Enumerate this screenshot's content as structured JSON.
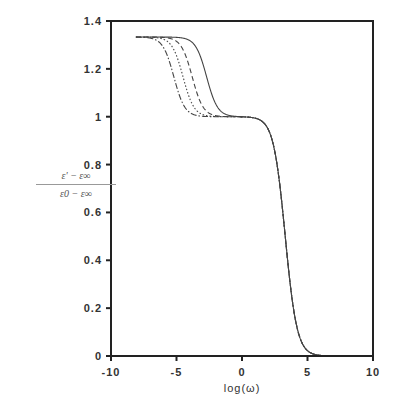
{
  "chart_data": {
    "type": "line",
    "title": "",
    "xlabel": "log(ω)",
    "ylabel": "(ε' − ε∞) / (ε0 − ε∞)",
    "ylabel_numerator": "ε' − ε∞",
    "ylabel_denominator": "ε0 − ε∞",
    "xlim": [
      -10,
      10
    ],
    "ylim": [
      0,
      1.4
    ],
    "xticks": [
      -10,
      -5,
      0,
      5,
      10
    ],
    "yticks": [
      0,
      0.2,
      0.4,
      0.6,
      0.8,
      1,
      1.2,
      1.4
    ],
    "xtick_labels": [
      "-10",
      "-5",
      "0",
      "5",
      "10"
    ],
    "ytick_labels": [
      "0",
      "0.2",
      "0.4",
      "0.6",
      "0.8",
      "1",
      "1.2",
      "1.4"
    ],
    "grid": false,
    "legend": null,
    "x_start": -8.1,
    "upper_level": 1.333,
    "middle_level": 1.0,
    "lower_level": 0.0,
    "second_step_center": 3.3,
    "second_step_width": 0.45,
    "first_step_width": 0.42,
    "series": [
      {
        "name": "curve-1",
        "style": "dash-dot",
        "first_step_center": -5.2
      },
      {
        "name": "curve-2",
        "style": "dotted",
        "first_step_center": -4.5
      },
      {
        "name": "curve-3",
        "style": "dashed",
        "first_step_center": -3.8
      },
      {
        "name": "curve-4",
        "style": "solid",
        "first_step_center": -2.7
      }
    ],
    "colors": {
      "axis": "#222222",
      "line": "#444444"
    }
  }
}
